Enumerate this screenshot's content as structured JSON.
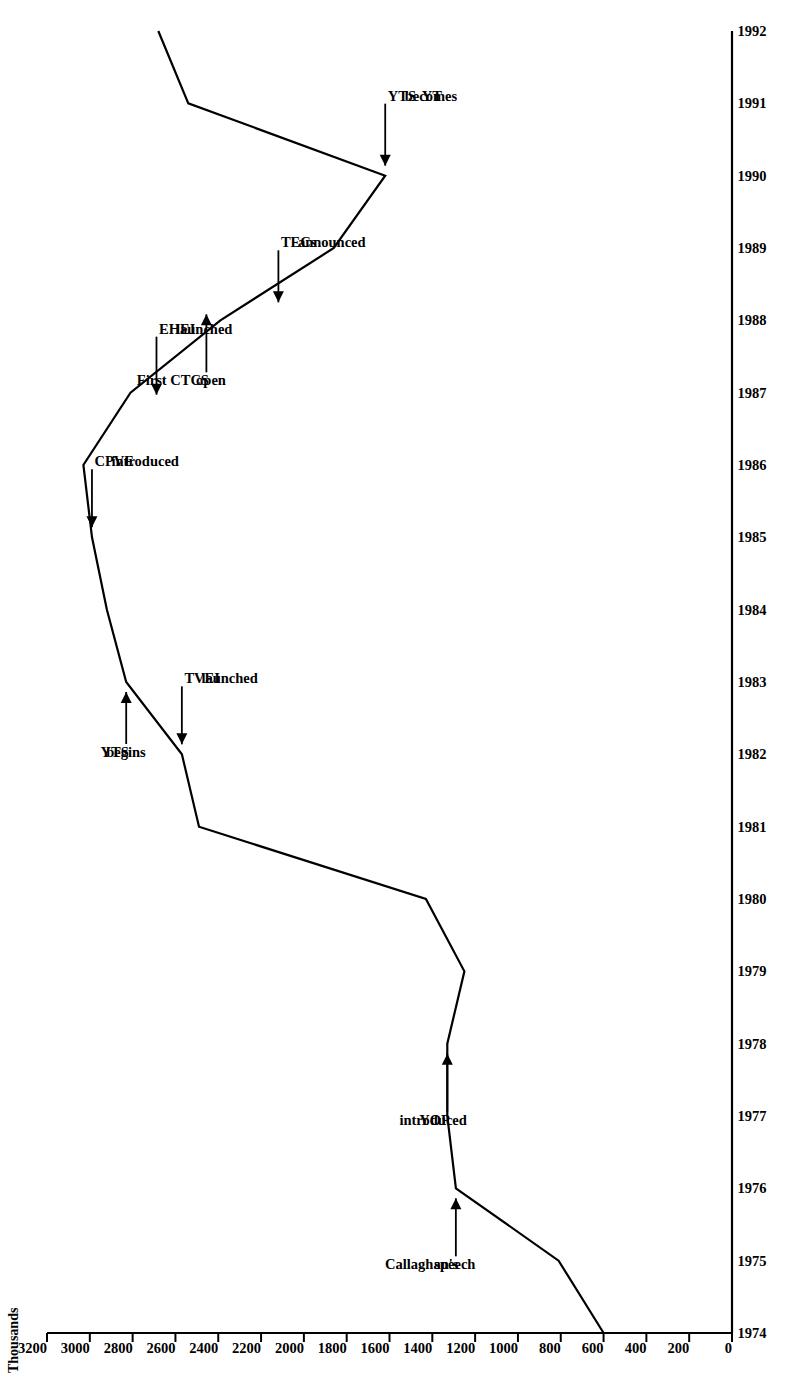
{
  "figure": {
    "y_axis_title": "Thousands",
    "orientation": "rotated-90-ccw"
  },
  "chart_data": {
    "type": "line",
    "title": "",
    "subtitle": "",
    "xlabel": "",
    "ylabel": "Thousands",
    "grid": false,
    "legend": "none",
    "xlim": [
      1974,
      1992
    ],
    "ylim": [
      0,
      3200
    ],
    "x": [
      1974,
      1975,
      1976,
      1977,
      1978,
      1979,
      1980,
      1981,
      1982,
      1983,
      1984,
      1985,
      1986,
      1987,
      1988,
      1989,
      1990,
      1991,
      1992
    ],
    "series": [
      {
        "name": "Participants",
        "values": [
          600,
          810,
          1290,
          1330,
          1330,
          1250,
          1430,
          2490,
          2570,
          2830,
          2920,
          2990,
          3030,
          2810,
          2390,
          1860,
          1620,
          2540,
          2680
        ]
      }
    ],
    "yticks": [
      0,
      200,
      400,
      600,
      800,
      1000,
      1200,
      1400,
      1600,
      1800,
      2000,
      2200,
      2400,
      2600,
      2800,
      3000,
      3200
    ],
    "ytick_labels": [
      "0",
      "200",
      "400",
      "600",
      "800",
      "1000",
      "1200",
      "1400",
      "1600",
      "1800",
      "2000",
      "2200",
      "2400",
      "2600",
      "2800",
      "3000",
      "3200"
    ],
    "xticks": [
      1974,
      1975,
      1976,
      1977,
      1978,
      1979,
      1980,
      1981,
      1982,
      1983,
      1984,
      1985,
      1986,
      1987,
      1988,
      1989,
      1990,
      1991,
      1992
    ],
    "xtick_labels": [
      "1974",
      "1975",
      "1976",
      "1977",
      "1978",
      "1979",
      "1980",
      "1981",
      "1982",
      "1983",
      "1984",
      "1985",
      "1986",
      "1987",
      "1988",
      "1989",
      "1990",
      "1991",
      "1992"
    ],
    "annotations": [
      {
        "id": "callaghans-speech",
        "lines": [
          "Callaghan's",
          "speech"
        ],
        "x": 1976,
        "y": 1290
      },
      {
        "id": "yop-introduced",
        "lines": [
          "YOP",
          "introduced"
        ],
        "x": 1978,
        "y": 1330
      },
      {
        "id": "tvei-launched",
        "lines": [
          "TVEI",
          "launched"
        ],
        "x": 1982,
        "y": 2570
      },
      {
        "id": "yts-begins",
        "lines": [
          "YTS",
          "begins"
        ],
        "x": 1983,
        "y": 2830
      },
      {
        "id": "cpve-introduced",
        "lines": [
          "CPVE",
          "introduced"
        ],
        "x": 1985,
        "y": 2990
      },
      {
        "id": "ehei-launched",
        "lines": [
          "EHEI",
          "launched"
        ],
        "x": 1987,
        "y": 2810
      },
      {
        "id": "first-ctcs-open",
        "lines": [
          "First CTCS",
          "open"
        ],
        "x": 1988,
        "y": 2390
      },
      {
        "id": "tecs-announced",
        "lines": [
          "TECs",
          "announced"
        ],
        "x": 1988,
        "y": 2390
      },
      {
        "id": "yts-becomes-yt",
        "lines": [
          "YTS",
          "becomes",
          "YT"
        ],
        "x": 1990,
        "y": 1620
      }
    ]
  },
  "colors": {
    "line": "#000000",
    "axis": "#000000",
    "background": "#ffffff",
    "text": "#000000"
  }
}
